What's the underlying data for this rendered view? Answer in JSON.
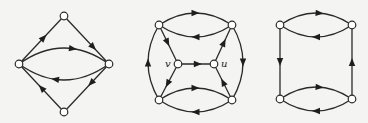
{
  "figure": {
    "background": "#f4f4f2",
    "stroke_color": "#2a2a2a",
    "node_radius": 3.8,
    "graphs": [
      {
        "id": "graph-1",
        "nodes": [
          {
            "id": "top",
            "x": 64,
            "y": 16,
            "label": ""
          },
          {
            "id": "left",
            "x": 19,
            "y": 64,
            "label": ""
          },
          {
            "id": "right",
            "x": 109,
            "y": 64,
            "label": ""
          },
          {
            "id": "bottom",
            "x": 64,
            "y": 112,
            "label": ""
          }
        ],
        "edges": [
          {
            "from": "left",
            "to": "top",
            "curve": 0,
            "arrow_t": 0.55
          },
          {
            "from": "top",
            "to": "right",
            "curve": 0,
            "arrow_t": 0.65
          },
          {
            "from": "left",
            "to": "right",
            "curve": -16,
            "arrow_t": 0.6
          },
          {
            "from": "right",
            "to": "left",
            "curve": -16,
            "arrow_t": 0.6
          },
          {
            "from": "right",
            "to": "bottom",
            "curve": 0,
            "arrow_t": 0.4
          },
          {
            "from": "bottom",
            "to": "left",
            "curve": 0,
            "arrow_t": 0.5
          }
        ]
      },
      {
        "id": "graph-2",
        "nodes": [
          {
            "id": "tl",
            "x": 159,
            "y": 25,
            "label": ""
          },
          {
            "id": "tr",
            "x": 232,
            "y": 25,
            "label": ""
          },
          {
            "id": "bl",
            "x": 159,
            "y": 100,
            "label": ""
          },
          {
            "id": "br",
            "x": 232,
            "y": 100,
            "label": ""
          },
          {
            "id": "v",
            "x": 178,
            "y": 64,
            "label": "v",
            "label_dx": -13,
            "label_dy": 3
          },
          {
            "id": "u",
            "x": 214,
            "y": 64,
            "label": "u",
            "label_dx": 7,
            "label_dy": 3
          }
        ],
        "edges": [
          {
            "from": "tl",
            "to": "tr",
            "curve": -12,
            "arrow_t": 0.5
          },
          {
            "from": "tr",
            "to": "tl",
            "curve": -12,
            "arrow_t": 0.5
          },
          {
            "from": "bl",
            "to": "br",
            "curve": -12,
            "arrow_t": 0.5
          },
          {
            "from": "br",
            "to": "bl",
            "curve": -12,
            "arrow_t": 0.5
          },
          {
            "from": "bl",
            "to": "tl",
            "curve": -11,
            "arrow_t": 0.5
          },
          {
            "from": "tr",
            "to": "br",
            "curve": -11,
            "arrow_t": 0.5
          },
          {
            "from": "tl",
            "to": "v",
            "curve": 0,
            "arrow_t": 0.45
          },
          {
            "from": "v",
            "to": "bl",
            "curve": 0,
            "arrow_t": 0.55
          },
          {
            "from": "v",
            "to": "u",
            "curve": 0,
            "arrow_t": 0.55
          },
          {
            "from": "u",
            "to": "tr",
            "curve": 0,
            "arrow_t": 0.55
          },
          {
            "from": "br",
            "to": "u",
            "curve": 0,
            "arrow_t": 0.5
          }
        ]
      },
      {
        "id": "graph-3",
        "nodes": [
          {
            "id": "tl",
            "x": 280,
            "y": 25,
            "label": ""
          },
          {
            "id": "tr",
            "x": 352,
            "y": 25,
            "label": ""
          },
          {
            "id": "bl",
            "x": 280,
            "y": 99,
            "label": ""
          },
          {
            "id": "br",
            "x": 352,
            "y": 99,
            "label": ""
          }
        ],
        "edges": [
          {
            "from": "tl",
            "to": "tr",
            "curve": -12,
            "arrow_t": 0.55
          },
          {
            "from": "tr",
            "to": "tl",
            "curve": -12,
            "arrow_t": 0.5
          },
          {
            "from": "bl",
            "to": "br",
            "curve": -12,
            "arrow_t": 0.55
          },
          {
            "from": "br",
            "to": "bl",
            "curve": -12,
            "arrow_t": 0.5
          },
          {
            "from": "tl",
            "to": "bl",
            "curve": 0,
            "arrow_t": 0.5
          },
          {
            "from": "br",
            "to": "tr",
            "curve": 0,
            "arrow_t": 0.5
          }
        ]
      }
    ]
  }
}
